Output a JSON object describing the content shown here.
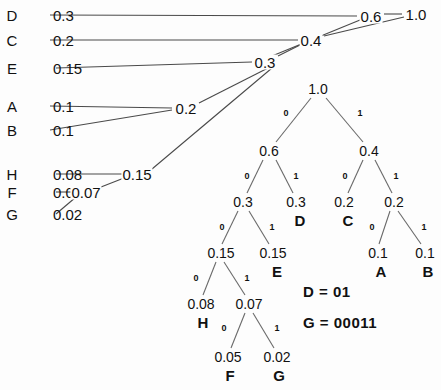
{
  "figure": {
    "type": "huffman-coding-diagram",
    "background_color": "#fdfdfd",
    "line_color": "#444444",
    "text_color": "#111111"
  },
  "symbol_list": {
    "rows": [
      {
        "symbol": "D",
        "probability": "0.3",
        "x_sym": 12,
        "y": 15
      },
      {
        "symbol": "C",
        "probability": "0.2",
        "x_sym": 12,
        "y": 40
      },
      {
        "symbol": "E",
        "probability": "0.15",
        "x_sym": 12,
        "y": 68
      },
      {
        "symbol": "A",
        "probability": "0.1",
        "x_sym": 12,
        "y": 106
      },
      {
        "symbol": "B",
        "probability": "0.1",
        "x_sym": 12,
        "y": 130
      },
      {
        "symbol": "H",
        "probability": "0.08",
        "x_sym": 12,
        "y": 174
      },
      {
        "symbol": "F",
        "probability": "0.05",
        "x_sym": 12,
        "y": 192
      },
      {
        "symbol": "G",
        "probability": "0.02",
        "x_sym": 12,
        "y": 214
      }
    ]
  },
  "merge_nodes": [
    {
      "label": "0.07",
      "x": 86,
      "y": 192
    },
    {
      "label": "0.15",
      "x": 137,
      "y": 174
    },
    {
      "label": "0.2",
      "x": 186,
      "y": 108
    },
    {
      "label": "0.3",
      "x": 265,
      "y": 62
    },
    {
      "label": "0.4",
      "x": 311,
      "y": 40
    },
    {
      "label": "0.6",
      "x": 371,
      "y": 16
    },
    {
      "label": "1.0",
      "x": 416,
      "y": 14
    }
  ],
  "merge_edges": [
    {
      "from": "D 0.3",
      "x1": 50,
      "y1": 15,
      "x2": 357,
      "y2": 16
    },
    {
      "from": "C 0.2",
      "x1": 50,
      "y1": 40,
      "x2": 298,
      "y2": 40
    },
    {
      "from": "E 0.15",
      "x1": 56,
      "y1": 68,
      "x2": 252,
      "y2": 62
    },
    {
      "from": "A 0.1",
      "x1": 50,
      "y1": 106,
      "x2": 172,
      "y2": 108
    },
    {
      "from": "B 0.1",
      "x1": 50,
      "y1": 130,
      "x2": 172,
      "y2": 110
    },
    {
      "from": "H 0.08",
      "x1": 56,
      "y1": 174,
      "x2": 122,
      "y2": 174
    },
    {
      "from": "F 0.05",
      "x1": 56,
      "y1": 192,
      "x2": 72,
      "y2": 192
    },
    {
      "from": "G 0.02",
      "x1": 56,
      "y1": 214,
      "x2": 76,
      "y2": 197
    },
    {
      "from": "0.07",
      "x1": 101,
      "y1": 187,
      "x2": 124,
      "y2": 178
    },
    {
      "from": "0.15",
      "x1": 152,
      "y1": 169,
      "x2": 272,
      "y2": 68
    },
    {
      "from": "0.2",
      "x1": 199,
      "y1": 103,
      "x2": 272,
      "y2": 66
    },
    {
      "from": "0.3",
      "x1": 278,
      "y1": 56,
      "x2": 300,
      "y2": 45
    },
    {
      "from": "0.3b",
      "x1": 272,
      "y1": 56,
      "x2": 360,
      "y2": 20
    },
    {
      "from": "0.4",
      "x1": 324,
      "y1": 36,
      "x2": 404,
      "y2": 17
    },
    {
      "from": "0.6",
      "x1": 384,
      "y1": 14,
      "x2": 402,
      "y2": 14
    }
  ],
  "code_tree": {
    "nodes": [
      {
        "id": "root",
        "label": "1.0",
        "x": 318,
        "y": 89,
        "leaf": null
      },
      {
        "id": "n0",
        "label": "0.6",
        "x": 269,
        "y": 151,
        "leaf": null
      },
      {
        "id": "n1",
        "label": "0.4",
        "x": 369,
        "y": 151,
        "leaf": null
      },
      {
        "id": "n00",
        "label": "0.3",
        "x": 243,
        "y": 202,
        "leaf": null
      },
      {
        "id": "n01",
        "label": "0.3",
        "x": 296,
        "y": 202,
        "leaf": "D"
      },
      {
        "id": "n10",
        "label": "0.2",
        "x": 344,
        "y": 202,
        "leaf": "C"
      },
      {
        "id": "n11",
        "label": "0.2",
        "x": 394,
        "y": 202,
        "leaf": null
      },
      {
        "id": "n000",
        "label": "0.15",
        "x": 221,
        "y": 253,
        "leaf": null
      },
      {
        "id": "n001",
        "label": "0.15",
        "x": 273,
        "y": 253,
        "leaf": "E"
      },
      {
        "id": "n110",
        "label": "0.1",
        "x": 378,
        "y": 253,
        "leaf": "A"
      },
      {
        "id": "n111",
        "label": "0.1",
        "x": 425,
        "y": 253,
        "leaf": "B"
      },
      {
        "id": "n0000",
        "label": "0.08",
        "x": 201,
        "y": 304,
        "leaf": "H"
      },
      {
        "id": "n0001",
        "label": "0.07",
        "x": 249,
        "y": 304,
        "leaf": null
      },
      {
        "id": "n00010",
        "label": "0.05",
        "x": 228,
        "y": 357,
        "leaf": "F"
      },
      {
        "id": "n00011",
        "label": "0.02",
        "x": 277,
        "y": 357,
        "leaf": "G"
      }
    ],
    "leaf_labels": [
      {
        "symbol": "D",
        "x": 300,
        "y": 220
      },
      {
        "symbol": "C",
        "x": 348,
        "y": 220
      },
      {
        "symbol": "E",
        "x": 277,
        "y": 271
      },
      {
        "symbol": "A",
        "x": 381,
        "y": 271
      },
      {
        "symbol": "B",
        "x": 428,
        "y": 271
      },
      {
        "symbol": "H",
        "x": 203,
        "y": 322
      },
      {
        "symbol": "F",
        "x": 230,
        "y": 375
      },
      {
        "symbol": "G",
        "x": 279,
        "y": 375
      }
    ],
    "edges": [
      {
        "from": "root",
        "to": "n0",
        "bit": "0",
        "x1": 311,
        "y1": 98,
        "x2": 276,
        "y2": 142,
        "bx": 286,
        "by": 113
      },
      {
        "from": "root",
        "to": "n1",
        "bit": "1",
        "x1": 326,
        "y1": 98,
        "x2": 363,
        "y2": 142,
        "bx": 360,
        "by": 113
      },
      {
        "from": "n0",
        "to": "n00",
        "bit": "0",
        "x1": 263,
        "y1": 160,
        "x2": 247,
        "y2": 193,
        "bx": 247,
        "by": 176
      },
      {
        "from": "n0",
        "to": "n01",
        "bit": "1",
        "x1": 276,
        "y1": 160,
        "x2": 293,
        "y2": 193,
        "bx": 296,
        "by": 176
      },
      {
        "from": "n1",
        "to": "n10",
        "bit": "0",
        "x1": 363,
        "y1": 160,
        "x2": 348,
        "y2": 193,
        "bx": 345,
        "by": 176
      },
      {
        "from": "n1",
        "to": "n11",
        "bit": "1",
        "x1": 375,
        "y1": 160,
        "x2": 392,
        "y2": 193,
        "bx": 396,
        "by": 176
      },
      {
        "from": "n00",
        "to": "n000",
        "bit": "0",
        "x1": 238,
        "y1": 211,
        "x2": 222,
        "y2": 244,
        "bx": 222,
        "by": 227
      },
      {
        "from": "n00",
        "to": "n001",
        "bit": "1",
        "x1": 249,
        "y1": 211,
        "x2": 269,
        "y2": 244,
        "bx": 272,
        "by": 227
      },
      {
        "from": "n11",
        "to": "n110",
        "bit": "0",
        "x1": 390,
        "y1": 211,
        "x2": 379,
        "y2": 244,
        "bx": 372,
        "by": 227
      },
      {
        "from": "n11",
        "to": "n111",
        "bit": "1",
        "x1": 398,
        "y1": 211,
        "x2": 421,
        "y2": 244,
        "bx": 424,
        "by": 227
      },
      {
        "from": "n000",
        "to": "n0000",
        "bit": "0",
        "x1": 216,
        "y1": 262,
        "x2": 203,
        "y2": 295,
        "bx": 196,
        "by": 278
      },
      {
        "from": "n000",
        "to": "n0001",
        "bit": "1",
        "x1": 224,
        "y1": 262,
        "x2": 245,
        "y2": 295,
        "bx": 247,
        "by": 278
      },
      {
        "from": "n0001",
        "to": "n00010",
        "bit": "0",
        "x1": 245,
        "y1": 313,
        "x2": 231,
        "y2": 348,
        "bx": 224,
        "by": 328
      },
      {
        "from": "n0001",
        "to": "n00011",
        "bit": "1",
        "x1": 253,
        "y1": 313,
        "x2": 274,
        "y2": 348,
        "bx": 277,
        "by": 328
      }
    ]
  },
  "code_examples": [
    {
      "text": "D = 01",
      "x": 303,
      "y": 291
    },
    {
      "text": "G = 00011",
      "x": 303,
      "y": 322
    }
  ],
  "chart_data": {
    "type": "diagram",
    "symbols": [
      "D",
      "C",
      "E",
      "A",
      "B",
      "H",
      "F",
      "G"
    ],
    "probabilities": [
      0.3,
      0.2,
      0.15,
      0.1,
      0.1,
      0.08,
      0.05,
      0.02
    ],
    "merge_sequence": [
      0.07,
      0.15,
      0.2,
      0.3,
      0.4,
      0.6,
      1.0
    ],
    "codes": {
      "D": "01",
      "G": "00011"
    }
  }
}
